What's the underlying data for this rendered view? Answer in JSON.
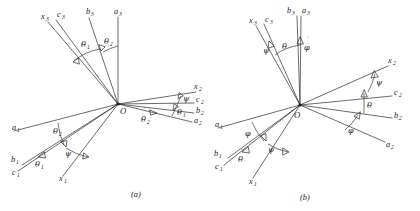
{
  "figure": {
    "background_color": "#ffffff",
    "line_color": "#2b2b2b",
    "text_color": "#1a1a1a",
    "panels": [
      {
        "id": "panel-a",
        "caption": "(a)",
        "origin_label": "O",
        "angle_scheme": "theta1-theta2-psi",
        "axis_labels": [
          {
            "name": "x3",
            "base": "x",
            "sub": "3"
          },
          {
            "name": "c3",
            "base": "c",
            "sub": "3"
          },
          {
            "name": "b3",
            "base": "b",
            "sub": "3"
          },
          {
            "name": "a3",
            "base": "a",
            "sub": "3"
          },
          {
            "name": "x2",
            "base": "x",
            "sub": "2"
          },
          {
            "name": "c2",
            "base": "c",
            "sub": "2"
          },
          {
            "name": "b2",
            "base": "b",
            "sub": "2"
          },
          {
            "name": "a2",
            "base": "a",
            "sub": "2"
          },
          {
            "name": "a1",
            "base": "a",
            "sub": "1"
          },
          {
            "name": "b1",
            "base": "b",
            "sub": "1"
          },
          {
            "name": "c1",
            "base": "c",
            "sub": "1"
          },
          {
            "name": "x1",
            "base": "x",
            "sub": "1"
          }
        ],
        "angle_labels": [
          {
            "name": "theta1-upper",
            "glyph": "θ",
            "sub": "1",
            "dot": false
          },
          {
            "name": "theta2-upper",
            "glyph": "θ",
            "sub": "2",
            "dot": false
          },
          {
            "name": "psi-right",
            "glyph": "ψ",
            "sub": "",
            "dot": false
          },
          {
            "name": "theta1-right",
            "glyph": "θ",
            "sub": "1",
            "dot": false
          },
          {
            "name": "theta2-dot-right",
            "glyph": "θ",
            "sub": "2",
            "dot": true
          },
          {
            "name": "theta2-left",
            "glyph": "θ",
            "sub": "2",
            "dot": false
          },
          {
            "name": "psi-left",
            "glyph": "ψ",
            "sub": "",
            "dot": false
          },
          {
            "name": "theta1-dot-left",
            "glyph": "θ",
            "sub": "1",
            "dot": true
          }
        ]
      },
      {
        "id": "panel-b",
        "caption": "(b)",
        "origin_label": "O",
        "angle_scheme": "phi-theta-psi",
        "axis_labels": [
          {
            "name": "x3",
            "base": "x",
            "sub": "3"
          },
          {
            "name": "c3",
            "base": "c",
            "sub": "3"
          },
          {
            "name": "b3",
            "base": "b",
            "sub": "3"
          },
          {
            "name": "a3",
            "base": "a",
            "sub": "3"
          },
          {
            "name": "x2",
            "base": "x",
            "sub": "2"
          },
          {
            "name": "c2",
            "base": "c",
            "sub": "2"
          },
          {
            "name": "b2",
            "base": "b",
            "sub": "2"
          },
          {
            "name": "a2",
            "base": "a",
            "sub": "2"
          },
          {
            "name": "a1",
            "base": "a",
            "sub": "1"
          },
          {
            "name": "b1",
            "base": "b",
            "sub": "1"
          },
          {
            "name": "c1",
            "base": "c",
            "sub": "1"
          },
          {
            "name": "x1",
            "base": "x",
            "sub": "1"
          }
        ],
        "angle_labels": [
          {
            "name": "psi-dot-upper",
            "glyph": "ψ",
            "sub": "",
            "dot": true
          },
          {
            "name": "theta-upper",
            "glyph": "θ",
            "sub": "",
            "dot": false
          },
          {
            "name": "phi-dot-upper",
            "glyph": "φ",
            "sub": "",
            "dot": true
          },
          {
            "name": "psi-right",
            "glyph": "ψ",
            "sub": "",
            "dot": false
          },
          {
            "name": "theta-right",
            "glyph": "θ",
            "sub": "",
            "dot": false
          },
          {
            "name": "phi-right",
            "glyph": "φ",
            "sub": "",
            "dot": false
          },
          {
            "name": "phi-left",
            "glyph": "φ",
            "sub": "",
            "dot": false
          },
          {
            "name": "psi-left",
            "glyph": "ψ",
            "sub": "",
            "dot": false
          },
          {
            "name": "theta-dot-left",
            "glyph": "θ",
            "sub": "",
            "dot": true
          }
        ]
      }
    ]
  }
}
